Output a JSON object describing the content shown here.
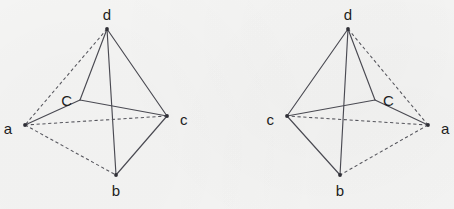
{
  "figure": {
    "type": "geometry-diagram",
    "background_color": "#f6f6f5",
    "stroke_color": "#4a4a52",
    "label_color": "#1d1d22",
    "panels": [
      {
        "id": "left",
        "name": "tetrahedron-left",
        "vertices": [
          {
            "id": "d",
            "label": "d",
            "x": 107,
            "y": 29,
            "label_x": 107,
            "label_y": 16
          },
          {
            "id": "a",
            "label": "a",
            "x": 25,
            "y": 125,
            "label_x": 12,
            "label_y": 130
          },
          {
            "id": "c",
            "label": "c",
            "x": 167,
            "y": 116,
            "label_x": 180,
            "label_y": 121
          },
          {
            "id": "b",
            "label": "b",
            "x": 116,
            "y": 175,
            "label_x": 116,
            "label_y": 192
          },
          {
            "id": "C",
            "label": "C",
            "x": 80,
            "y": 100,
            "label_x": 72,
            "label_y": 102
          }
        ],
        "edges": [
          {
            "from": "d",
            "to": "a",
            "style": "dashed"
          },
          {
            "from": "d",
            "to": "c",
            "style": "solid"
          },
          {
            "from": "d",
            "to": "b",
            "style": "solid"
          },
          {
            "from": "a",
            "to": "c",
            "style": "dashed"
          },
          {
            "from": "a",
            "to": "b",
            "style": "dashed"
          },
          {
            "from": "c",
            "to": "b",
            "style": "solid"
          },
          {
            "from": "C",
            "to": "d",
            "style": "solid"
          },
          {
            "from": "C",
            "to": "c",
            "style": "solid"
          },
          {
            "from": "C",
            "to": "a",
            "style": "solid"
          }
        ]
      },
      {
        "id": "right",
        "name": "tetrahedron-right",
        "vertices": [
          {
            "id": "d",
            "label": "d",
            "x": 348,
            "y": 29,
            "label_x": 348,
            "label_y": 16
          },
          {
            "id": "a",
            "label": "a",
            "x": 428,
            "y": 125,
            "label_x": 441,
            "label_y": 130
          },
          {
            "id": "c",
            "label": "c",
            "x": 287,
            "y": 116,
            "label_x": 274,
            "label_y": 121
          },
          {
            "id": "b",
            "label": "b",
            "x": 340,
            "y": 175,
            "label_x": 340,
            "label_y": 192
          },
          {
            "id": "C",
            "label": "C",
            "x": 375,
            "y": 100,
            "label_x": 383,
            "label_y": 102
          }
        ],
        "edges": [
          {
            "from": "d",
            "to": "a",
            "style": "dashed"
          },
          {
            "from": "d",
            "to": "c",
            "style": "solid"
          },
          {
            "from": "d",
            "to": "b",
            "style": "solid"
          },
          {
            "from": "a",
            "to": "c",
            "style": "dashed"
          },
          {
            "from": "a",
            "to": "b",
            "style": "dashed"
          },
          {
            "from": "c",
            "to": "b",
            "style": "solid"
          },
          {
            "from": "C",
            "to": "d",
            "style": "solid"
          },
          {
            "from": "C",
            "to": "c",
            "style": "solid"
          },
          {
            "from": "C",
            "to": "a",
            "style": "solid"
          }
        ]
      }
    ]
  }
}
